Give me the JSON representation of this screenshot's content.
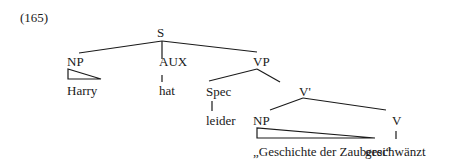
{
  "example_number": "(165)",
  "tree": {
    "root": "S",
    "nodes": {
      "s": "S",
      "np_subject": "NP",
      "aux": "AUX",
      "vp": "VP",
      "spec": "Spec",
      "v_bar": "V'",
      "np_object": "NP",
      "v": "V"
    },
    "leaves": {
      "harry": "Harry",
      "hat": "hat",
      "leider": "leider",
      "object_phrase": "„Geschichte der Zauberei“",
      "geschwaenzt": "geschwänzt"
    }
  }
}
